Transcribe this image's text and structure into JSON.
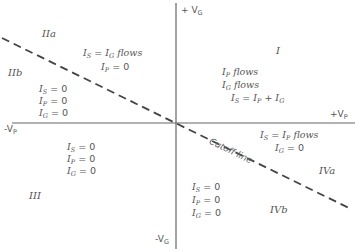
{
  "axes": {
    "plus_vg": "+ V",
    "plus_vg_sub": "G",
    "minus_vg": "-V",
    "minus_vg_sub": "G",
    "plus_vp": "+V",
    "plus_vp_sub": "P",
    "minus_vp": "-V",
    "minus_vp_sub": "P"
  },
  "cutoff_label": "Cutoff line",
  "regions": {
    "I": "I",
    "IIa": "IIa",
    "IIb": "IIb",
    "III": "III",
    "IVa": "IVa",
    "IVb": "IVb"
  },
  "conditions": {
    "region_I": [
      "I_P flows",
      "I_G flows",
      "I_S = I_P + I_G"
    ],
    "region_IIa": [
      "I_S = I_G flows",
      "I_P = 0"
    ],
    "region_IIb": [
      "I_S = 0",
      "I_P = 0",
      "I_G = 0"
    ],
    "region_III": [
      "I_S = 0",
      "I_P = 0",
      "I_G = 0"
    ],
    "region_IVa": [
      "I_S = I_P flows",
      "I_G = 0"
    ],
    "region_IVb": [
      "I_S = 0",
      "I_P = 0",
      "I_G = 0"
    ]
  },
  "colors": {
    "ink": "#555555",
    "axis": "#666666",
    "dash": "#444444",
    "background": "#ffffff"
  }
}
